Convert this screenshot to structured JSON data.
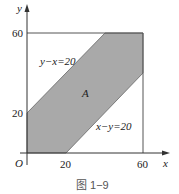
{
  "figure": {
    "caption": "图 1−9",
    "axes": {
      "x_label": "x",
      "y_label": "y",
      "origin_label": "O",
      "x_ticks": [
        "20",
        "60"
      ],
      "y_ticks": [
        "20",
        "60"
      ]
    },
    "region_label": "A",
    "lines": [
      {
        "label": "y−x=20"
      },
      {
        "label": "x−y=20"
      }
    ],
    "colors": {
      "shade": "#a9a9a9",
      "line": "#555555",
      "background": "#ffffff"
    }
  }
}
